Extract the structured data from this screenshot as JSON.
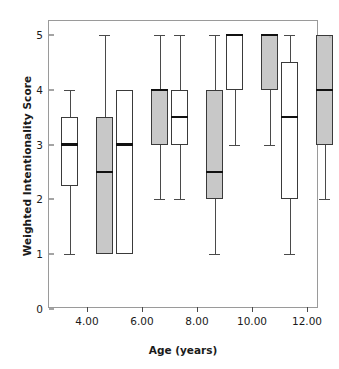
{
  "chart_data": {
    "type": "box",
    "title": "",
    "xlabel": "Age (years)",
    "ylabel": "Weighted Intentionality Score",
    "ylim": [
      0,
      5
    ],
    "yticks": [
      0,
      1,
      2,
      3,
      4,
      5
    ],
    "ytick_labels": [
      "0",
      "1",
      "2",
      "3",
      "4",
      "5"
    ],
    "categories": [
      "4.00",
      "6.00",
      "8.00",
      "10.00",
      "12.00"
    ],
    "xtick_labels": [
      "4.00",
      "6.00",
      "8.00",
      "10.00",
      "12.00"
    ],
    "grid": false,
    "legend": "none",
    "series": [
      {
        "name": "white",
        "fill": "#ffffff",
        "boxes": [
          {
            "category": "4.00",
            "whisker_low": 1,
            "q1": 2.25,
            "median": 3,
            "q3": 3.5,
            "whisker_high": 4
          },
          {
            "category": "6.00",
            "whisker_low": 1,
            "q1": 1,
            "median": 3,
            "q3": 4,
            "whisker_high": 4
          },
          {
            "category": "8.00",
            "whisker_low": 2,
            "q1": 3,
            "median": 3.5,
            "q3": 4,
            "whisker_high": 5
          },
          {
            "category": "10.00",
            "whisker_low": 3,
            "q1": 4,
            "median": 5,
            "q3": 5,
            "whisker_high": 5
          },
          {
            "category": "12.00",
            "whisker_low": 1,
            "q1": 2,
            "median": 3.5,
            "q3": 4.5,
            "whisker_high": 5
          }
        ]
      },
      {
        "name": "gray",
        "fill": "#c8c8c8",
        "boxes": [
          {
            "category": "4.00",
            "whisker_low": 1,
            "q1": 1,
            "median": 2.5,
            "q3": 3.5,
            "whisker_high": 5
          },
          {
            "category": "6.00",
            "whisker_low": 2,
            "q1": 3,
            "median": 4,
            "q3": 4,
            "whisker_high": 5
          },
          {
            "category": "8.00",
            "whisker_low": 1,
            "q1": 2,
            "median": 2.5,
            "q3": 4,
            "whisker_high": 5
          },
          {
            "category": "10.00",
            "whisker_low": 3,
            "q1": 4,
            "median": 5,
            "q3": 5,
            "whisker_high": 5
          },
          {
            "category": "12.00",
            "whisker_low": 2,
            "q1": 3,
            "median": 4,
            "q3": 5,
            "whisker_high": 5
          }
        ]
      }
    ],
    "colors": {
      "box_stroke": "#3a3a3a",
      "median_stroke": "#111111",
      "whisker_stroke": "#4a4a4a",
      "frame_stroke": "#9a9a9a",
      "white_fill": "#ffffff",
      "gray_fill": "#c8c8c8",
      "text": "#1a1a1a",
      "background": "#ffffff"
    },
    "geometry": {
      "plot_left": 48,
      "plot_top": 20,
      "plot_width": 270,
      "plot_height": 288,
      "y_top_value": 5,
      "y_top_px": 14,
      "y_bottom_value": 0,
      "y_bottom_px": 288,
      "group_centers_px": [
        38,
        93,
        148,
        203,
        258
      ],
      "box_width_px": 17,
      "pair_offset_px": 9
    }
  }
}
